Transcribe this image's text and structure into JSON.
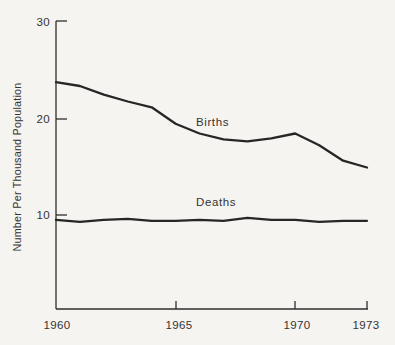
{
  "figure": {
    "background_color": "#f6f4f0",
    "ink_color": "#262626",
    "text_color": "#333333"
  },
  "y_axis": {
    "title": "Number Per Thousand Population",
    "tick_labels": [
      "30",
      "20",
      "10"
    ]
  },
  "x_axis": {
    "tick_labels": [
      "1960",
      "1965",
      "1970",
      "1973"
    ]
  },
  "chart_data": {
    "type": "line",
    "title": "",
    "xlabel": "",
    "ylabel": "Number Per Thousand Population",
    "x": [
      1960,
      1961,
      1962,
      1963,
      1964,
      1965,
      1966,
      1967,
      1968,
      1969,
      1970,
      1971,
      1972,
      1973
    ],
    "series": [
      {
        "name": "Births",
        "values": [
          23.7,
          23.3,
          22.4,
          21.7,
          21.1,
          19.4,
          18.4,
          17.8,
          17.6,
          17.9,
          18.4,
          17.2,
          15.6,
          14.9
        ]
      },
      {
        "name": "Deaths",
        "values": [
          9.5,
          9.3,
          9.5,
          9.6,
          9.4,
          9.4,
          9.5,
          9.4,
          9.7,
          9.5,
          9.5,
          9.3,
          9.4,
          9.4
        ]
      }
    ],
    "xlim": [
      1960,
      1973
    ],
    "ylim": [
      0,
      30
    ],
    "yticks": [
      30,
      20,
      10
    ],
    "xticks": [
      1960,
      1965,
      1970,
      1973
    ],
    "grid": false,
    "legend_position": "inline-labels-on-lines"
  }
}
